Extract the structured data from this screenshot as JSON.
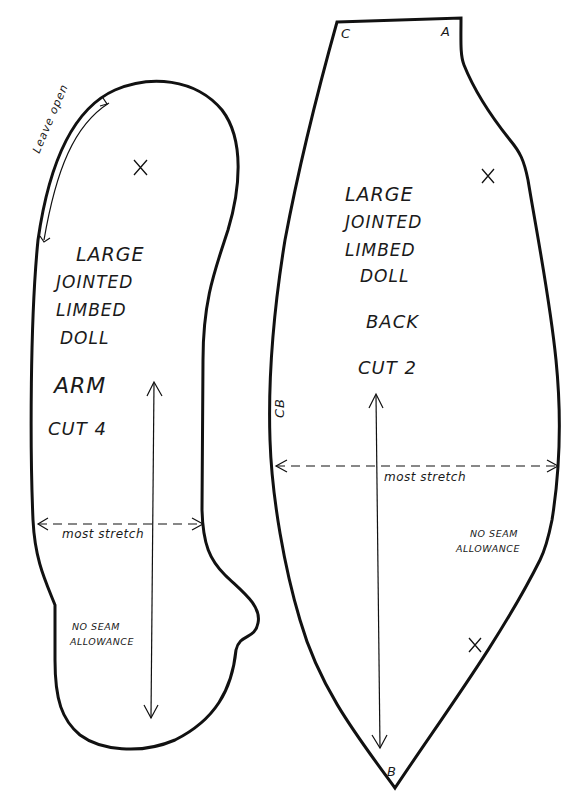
{
  "pieces": {
    "arm": {
      "title_lines": [
        "LARGE",
        "JOINTED",
        "LIMBED",
        "DOLL"
      ],
      "piece_name": "ARM",
      "cut": "CUT 4",
      "leave_open": "Leave open",
      "stretch_label": "most stretch",
      "seam_note": [
        "NO SEAM",
        "ALLOWANCE"
      ],
      "marker": "X"
    },
    "back": {
      "title_lines": [
        "LARGE",
        "JOINTED",
        "LIMBED",
        "DOLL"
      ],
      "piece_name": "BACK",
      "cut": "CUT 2",
      "stretch_label": "most stretch",
      "seam_note": [
        "NO SEAM",
        "ALLOWANCE"
      ],
      "corner_labels": {
        "top_left": "C",
        "top_right": "A",
        "bottom": "B"
      },
      "side_label": "CB",
      "markers": [
        "X",
        "X"
      ]
    }
  },
  "colors": {
    "line": "#111111",
    "background": "#ffffff"
  }
}
